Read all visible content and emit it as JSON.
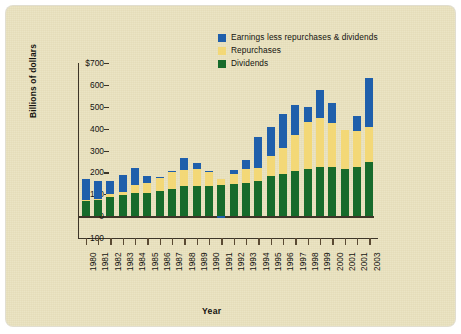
{
  "colors": {
    "background": "#e9e1bd",
    "dividends": "#176b2b",
    "repurchases": "#f3d877",
    "earnings_less": "#1f5fab",
    "axis": "#3d3528",
    "text": "#14130f"
  },
  "legend": {
    "position": "top-right",
    "items": [
      {
        "label": "Earnings less repurchases & dividends",
        "color": "#1f5fab",
        "icon": "legend-swatch-icon"
      },
      {
        "label": "Repurchases",
        "color": "#f3d877",
        "icon": "legend-swatch-icon"
      },
      {
        "label": "Dividends",
        "color": "#176b2b",
        "icon": "legend-swatch-icon"
      }
    ]
  },
  "chart_data": {
    "type": "bar",
    "stacked": true,
    "title": "",
    "xlabel": "Year",
    "ylabel": "Billions of dollars",
    "ylim": [
      -100,
      700
    ],
    "yticks": [
      -100,
      0,
      100,
      200,
      300,
      400,
      500,
      600,
      700
    ],
    "ytick_labels": [
      "-100",
      "0",
      "100",
      "200",
      "300",
      "400",
      "500",
      "600",
      "$700"
    ],
    "grid": false,
    "legend_position": "top-right",
    "categories": [
      "1980",
      "1981",
      "1982",
      "1983",
      "1984",
      "1985",
      "1986",
      "1987",
      "1988",
      "1989",
      "1990",
      "1991",
      "1992",
      "1993",
      "1994",
      "1995",
      "1996",
      "1997",
      "1998",
      "1999",
      "2000",
      "2001",
      "2001",
      "2003"
    ],
    "series": [
      {
        "name": "Dividends",
        "color": "#176b2b",
        "values": [
          70,
          74,
          89,
          96,
          104,
          107,
          117,
          124,
          139,
          139,
          139,
          141,
          145,
          153,
          159,
          182,
          192,
          205,
          216,
          224,
          224,
          215,
          224,
          247
        ]
      },
      {
        "name": "Repurchases",
        "color": "#f3d877",
        "values": [
          2,
          3,
          10,
          14,
          37,
          43,
          57,
          77,
          74,
          76,
          64,
          31,
          47,
          62,
          60,
          91,
          118,
          164,
          215,
          224,
          200,
          180,
          165,
          159
        ]
      },
      {
        "name": "Earnings less repurchases & dividends",
        "color": "#1f5fab",
        "values": [
          96,
          84,
          63,
          78,
          77,
          35,
          6,
          7,
          51,
          28,
          3,
          -9,
          18,
          40,
          144,
          135,
          158,
          138,
          68,
          130,
          95,
          0,
          70,
          224
        ]
      }
    ],
    "totals": [
      168,
      161,
      162,
      188,
      218,
      185,
      180,
      208,
      264,
      243,
      206,
      163,
      210,
      255,
      363,
      408,
      468,
      507,
      499,
      578,
      519,
      395,
      459,
      630
    ]
  }
}
